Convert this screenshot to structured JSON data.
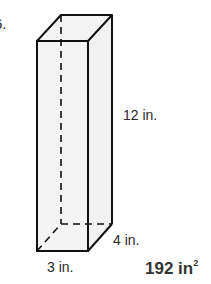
{
  "problem": {
    "number_fragment": "6.",
    "figure": "rectangular-prism",
    "dimensions": {
      "height": "12 in.",
      "depth": "4 in.",
      "width": "3 in."
    },
    "answer": {
      "value": "192 in",
      "exponent": "2"
    }
  }
}
